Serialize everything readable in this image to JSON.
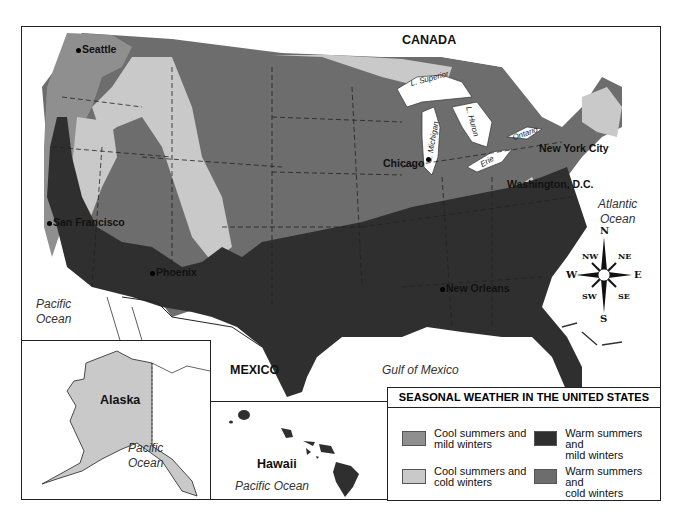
{
  "map": {
    "title": "SEASONAL WEATHER IN THE UNITED STATES",
    "regions": {
      "canada": "CANADA",
      "mexico": "MEXICO",
      "alaska": "Alaska",
      "hawaii": "Hawaii"
    },
    "water": {
      "pacific_main": [
        "Pacific",
        "Ocean"
      ],
      "atlantic": [
        "Atlantic",
        "Ocean"
      ],
      "gulf": "Gulf  of  Mexico",
      "pacific_alaska": [
        "Pacific",
        "Ocean"
      ],
      "pacific_hawaii": "Pacific Ocean"
    },
    "lakes": {
      "superior": "L. Superior",
      "michigan": "L. Michigan",
      "huron": "L. Huron",
      "erie": "Erie",
      "ontario": "Ontario"
    },
    "cities": {
      "seattle": "Seattle",
      "san_francisco": "San Francisco",
      "phoenix": "Phoenix",
      "chicago": "Chicago",
      "new_york": "New York City",
      "washington": "Washington, D.C.",
      "new_orleans": "New Orleans"
    },
    "compass": {
      "n": "N",
      "s": "S",
      "e": "E",
      "w": "W",
      "ne": "NE",
      "nw": "NW",
      "se": "SE",
      "sw": "SW"
    },
    "colors": {
      "cool_mild": "#8f8f8f",
      "cool_cold": "#c9c9c9",
      "warm_mild": "#2f2f2f",
      "warm_cold": "#6d6d6d"
    }
  },
  "legend": {
    "title": "SEASONAL WEATHER IN THE UNITED STATES",
    "items": [
      {
        "label1": "Cool summers and",
        "label2": "mild winters",
        "color": "#8f8f8f"
      },
      {
        "label1": "Warm summers and",
        "label2": "mild winters",
        "color": "#2f2f2f"
      },
      {
        "label1": "Cool summers and",
        "label2": "cold winters",
        "color": "#c9c9c9"
      },
      {
        "label1": "Warm summers and",
        "label2": "cold winters",
        "color": "#6d6d6d"
      }
    ]
  }
}
